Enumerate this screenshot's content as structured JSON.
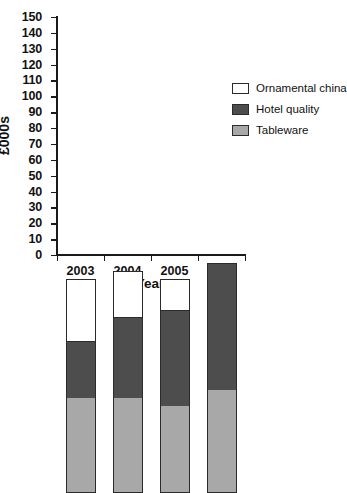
{
  "chart_data": {
    "type": "bar",
    "subtype": "stacked-column",
    "title": "",
    "xlabel": "Year",
    "ylabel": "£000s",
    "categories": [
      "2003",
      "2004",
      "2005",
      "2006"
    ],
    "series": [
      {
        "name": "Tableware",
        "color": "#a8a8a8",
        "values": [
          60,
          60,
          55,
          65
        ]
      },
      {
        "name": "Hotel quality",
        "color": "#4d4d4d",
        "values": [
          35,
          50,
          60,
          80
        ]
      },
      {
        "name": "Ornamental china",
        "color": "#ffffff",
        "values": [
          40,
          30,
          20,
          0
        ]
      }
    ],
    "stack_totals": [
      135,
      140,
      135,
      145
    ],
    "ylim": [
      0,
      150
    ],
    "ytick_step": 10,
    "yticks": [
      0,
      10,
      20,
      30,
      40,
      50,
      60,
      70,
      80,
      90,
      100,
      110,
      120,
      130,
      140,
      150
    ],
    "ytick_labels": [
      "0",
      "10",
      "20",
      "30",
      "40",
      "50",
      "60",
      "70",
      "80",
      "90",
      "100",
      "110",
      "120",
      "130",
      "140",
      "150"
    ],
    "grid": false,
    "legend_position": "right"
  },
  "legend": {
    "items": [
      {
        "label": "Ornamental china"
      },
      {
        "label": "Hotel quality"
      },
      {
        "label": "Tableware"
      }
    ]
  },
  "axes": {
    "y_title": "£000s",
    "x_title": "Year"
  },
  "caption": {
    "text": ""
  }
}
